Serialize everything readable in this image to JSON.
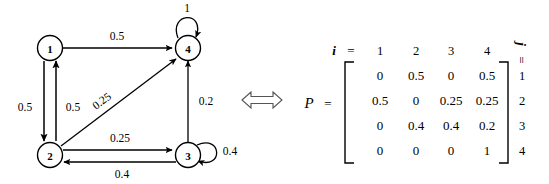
{
  "figure": {
    "equivalence_symbol": "double-headed-arrow"
  },
  "graph": {
    "nodes": [
      {
        "id": "n1",
        "label": "1",
        "cx": 50,
        "cy": 48
      },
      {
        "id": "n2",
        "label": "2",
        "cx": 50,
        "cy": 155
      },
      {
        "id": "n3",
        "label": "3",
        "cx": 188,
        "cy": 155
      },
      {
        "id": "n4",
        "label": "4",
        "cx": 188,
        "cy": 48
      }
    ],
    "edges": [
      {
        "from": "1",
        "to": "4",
        "label": "0.5"
      },
      {
        "from": "1",
        "to": "2",
        "label": "0.5"
      },
      {
        "from": "2",
        "to": "1",
        "label": "0.5"
      },
      {
        "from": "2",
        "to": "4",
        "label": "0.25"
      },
      {
        "from": "2",
        "to": "3",
        "label": "0.25"
      },
      {
        "from": "3",
        "to": "2",
        "label": "0.4"
      },
      {
        "from": "3",
        "to": "3",
        "label": "0.4"
      },
      {
        "from": "3",
        "to": "4",
        "label": "0.2"
      },
      {
        "from": "4",
        "to": "4",
        "label": "1"
      }
    ],
    "labels": {
      "e_1_4": "0.5",
      "e_1_2": "0.5",
      "e_2_1": "0.5",
      "e_2_4": "0.25",
      "e_2_3": "0.25",
      "e_3_2": "0.4",
      "e_3_3": "0.4",
      "e_3_4": "0.2",
      "e_4_4": "1"
    }
  },
  "matrix": {
    "name": "P",
    "equals": "=",
    "i_symbol": "i",
    "i_equals": "=",
    "j_symbol": "j",
    "j_equals": "=",
    "col_headers": [
      "1",
      "2",
      "3",
      "4"
    ],
    "row_labels": [
      "1",
      "2",
      "3",
      "4"
    ],
    "rows": [
      [
        "0",
        "0.5",
        "0",
        "0.5"
      ],
      [
        "0.5",
        "0",
        "0.25",
        "0.25"
      ],
      [
        "0",
        "0.4",
        "0.4",
        "0.2"
      ],
      [
        "0",
        "0",
        "0",
        "1"
      ]
    ]
  },
  "colors": {
    "ink": "#000000",
    "background": "#ffffff"
  }
}
